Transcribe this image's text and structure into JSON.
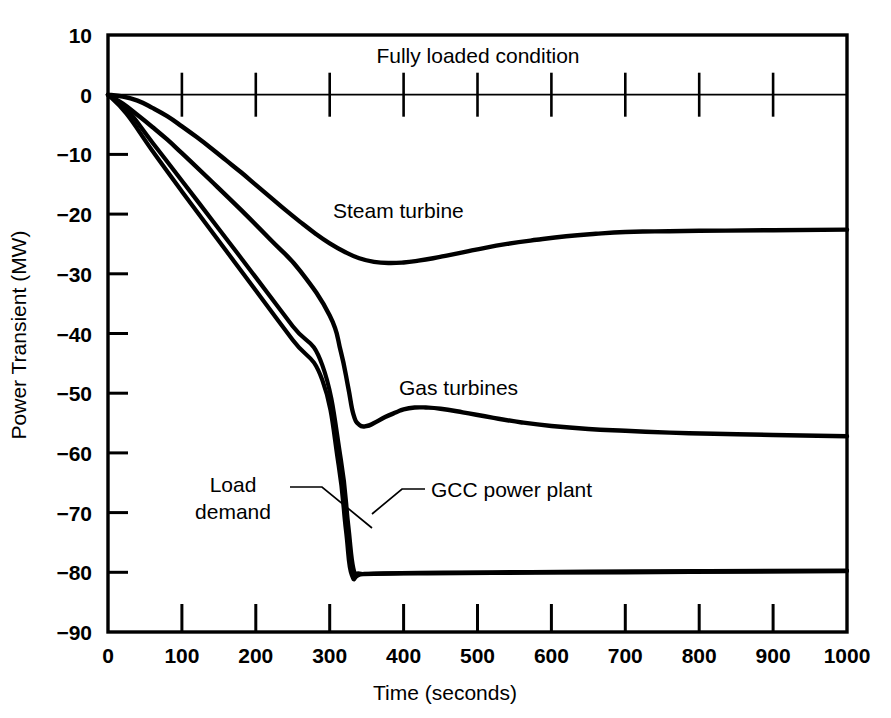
{
  "chart_data": {
    "type": "line",
    "title": "",
    "xlabel": "Time (seconds)",
    "ylabel": "Power Transient (MW)",
    "xlim": [
      0,
      1000
    ],
    "ylim": [
      -90,
      10
    ],
    "xticks": [
      "0",
      "100",
      "200",
      "300",
      "400",
      "500",
      "600",
      "700",
      "800",
      "900",
      "1000"
    ],
    "yticks": [
      "10",
      "0",
      "-10",
      "-20",
      "-30",
      "-40",
      "-50",
      "-60",
      "-70",
      "-80",
      "-90"
    ],
    "grid": false,
    "legend_position": "inline-annotations",
    "annotations": [
      {
        "name": "fully-loaded-condition",
        "text": "Fully loaded condition",
        "x": 470,
        "y": 5
      },
      {
        "name": "steam-turbine-label",
        "text": "Steam turbine",
        "x": 400,
        "y": -21
      },
      {
        "name": "gas-turbines-label",
        "text": "Gas turbines",
        "x": 430,
        "y": -48
      },
      {
        "name": "gcc-power-plant-label",
        "text": "GCC power plant",
        "x": 450,
        "y": -68
      },
      {
        "name": "load-demand-label-line1",
        "text": "Load",
        "x": 200,
        "y": -66
      },
      {
        "name": "load-demand-label-line2",
        "text": "demand",
        "x": 200,
        "y": -71
      }
    ],
    "series": [
      {
        "name": "Steam turbine",
        "points": [
          [
            0,
            0
          ],
          [
            20,
            -0.3
          ],
          [
            40,
            -1.0
          ],
          [
            60,
            -2.2
          ],
          [
            80,
            -3.6
          ],
          [
            100,
            -5.3
          ],
          [
            120,
            -7.1
          ],
          [
            140,
            -9.0
          ],
          [
            160,
            -11.0
          ],
          [
            180,
            -13.0
          ],
          [
            200,
            -15.1
          ],
          [
            220,
            -17.2
          ],
          [
            240,
            -19.3
          ],
          [
            260,
            -21.3
          ],
          [
            280,
            -23.2
          ],
          [
            300,
            -24.9
          ],
          [
            320,
            -26.3
          ],
          [
            340,
            -27.4
          ],
          [
            360,
            -28.0
          ],
          [
            380,
            -28.2
          ],
          [
            400,
            -28.1
          ],
          [
            420,
            -27.8
          ],
          [
            440,
            -27.4
          ],
          [
            460,
            -26.9
          ],
          [
            480,
            -26.4
          ],
          [
            500,
            -25.9
          ],
          [
            540,
            -25.0
          ],
          [
            580,
            -24.3
          ],
          [
            620,
            -23.7
          ],
          [
            660,
            -23.3
          ],
          [
            700,
            -23.0
          ],
          [
            740,
            -22.9
          ],
          [
            800,
            -22.8
          ],
          [
            900,
            -22.7
          ],
          [
            1000,
            -22.6
          ]
        ]
      },
      {
        "name": "Gas turbines",
        "points": [
          [
            0,
            0
          ],
          [
            20,
            -1.5
          ],
          [
            40,
            -3.4
          ],
          [
            60,
            -5.4
          ],
          [
            80,
            -7.5
          ],
          [
            100,
            -9.8
          ],
          [
            140,
            -14.5
          ],
          [
            180,
            -19.3
          ],
          [
            220,
            -24.3
          ],
          [
            260,
            -29.5
          ],
          [
            300,
            -37.0
          ],
          [
            315,
            -43.0
          ],
          [
            325,
            -49.0
          ],
          [
            332,
            -53.5
          ],
          [
            340,
            -55.3
          ],
          [
            350,
            -55.5
          ],
          [
            360,
            -55.0
          ],
          [
            375,
            -54.0
          ],
          [
            390,
            -53.2
          ],
          [
            400,
            -52.7
          ],
          [
            415,
            -52.4
          ],
          [
            430,
            -52.4
          ],
          [
            450,
            -52.6
          ],
          [
            480,
            -53.2
          ],
          [
            520,
            -54.1
          ],
          [
            560,
            -54.9
          ],
          [
            600,
            -55.5
          ],
          [
            650,
            -56.0
          ],
          [
            700,
            -56.3
          ],
          [
            760,
            -56.6
          ],
          [
            820,
            -56.8
          ],
          [
            900,
            -57.0
          ],
          [
            1000,
            -57.2
          ]
        ]
      },
      {
        "name": "GCC power plant",
        "points": [
          [
            0,
            0
          ],
          [
            25,
            -2.4
          ],
          [
            60,
            -8.0
          ],
          [
            100,
            -14.4
          ],
          [
            150,
            -22.5
          ],
          [
            200,
            -30.6
          ],
          [
            250,
            -38.8
          ],
          [
            290,
            -45.3
          ],
          [
            315,
            -61.0
          ],
          [
            325,
            -72.0
          ],
          [
            332,
            -79.3
          ],
          [
            340,
            -80.2
          ],
          [
            360,
            -80.2
          ],
          [
            420,
            -80.1
          ],
          [
            520,
            -80.0
          ],
          [
            650,
            -79.9
          ],
          [
            800,
            -79.8
          ],
          [
            1000,
            -79.7
          ]
        ]
      },
      {
        "name": "Load demand",
        "points": [
          [
            0,
            0
          ],
          [
            25,
            -3.2
          ],
          [
            60,
            -9.4
          ],
          [
            100,
            -16.2
          ],
          [
            150,
            -24.5
          ],
          [
            200,
            -32.8
          ],
          [
            250,
            -41.1
          ],
          [
            290,
            -47.8
          ],
          [
            312,
            -62.0
          ],
          [
            322,
            -73.0
          ],
          [
            330,
            -80.5
          ],
          [
            345,
            -80.3
          ],
          [
            400,
            -80.2
          ],
          [
            520,
            -80.1
          ],
          [
            700,
            -80.0
          ],
          [
            1000,
            -79.8
          ]
        ]
      }
    ]
  },
  "colors": {
    "line": "#000000",
    "axis": "#000000",
    "background": "#ffffff"
  }
}
